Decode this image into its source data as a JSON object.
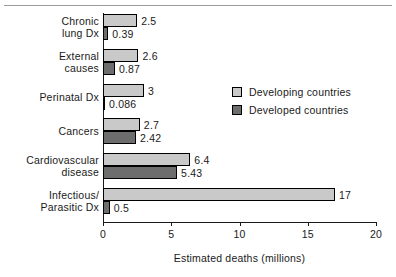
{
  "chart_data": {
    "type": "bar",
    "orientation": "horizontal",
    "title": "",
    "xlabel": "Estimated deaths (millions)",
    "ylabel": "",
    "xlim": [
      0,
      20
    ],
    "xticks": [
      0,
      5,
      10,
      15,
      20
    ],
    "xtick_labels": [
      "0",
      "5",
      "10",
      "15",
      "20"
    ],
    "grid": false,
    "legend_position": "center-right",
    "categories": [
      "Chronic\nlung Dx",
      "External\ncauses",
      "Perinatal Dx",
      "Cancers",
      "Cardiovascular\ndisease",
      "Infectious/\nParasitic Dx"
    ],
    "series": [
      {
        "name": "Developing countries",
        "color": "#c9c9c9",
        "values": [
          2.5,
          2.6,
          3,
          2.7,
          6.4,
          17
        ],
        "value_labels": [
          "2.5",
          "2.6",
          "3",
          "2.7",
          "6.4",
          "17"
        ]
      },
      {
        "name": "Developed countries",
        "color": "#6d6d6d",
        "values": [
          0.39,
          0.87,
          0.086,
          2.42,
          5.43,
          0.5
        ],
        "value_labels": [
          "0.39",
          "0.87",
          "0.086",
          "2.42",
          "5.43",
          "0.5"
        ]
      }
    ]
  },
  "legend": {
    "items": [
      {
        "label": "Developing countries",
        "swatch": "developing"
      },
      {
        "label": "Developed countries",
        "swatch": "developed"
      }
    ]
  }
}
